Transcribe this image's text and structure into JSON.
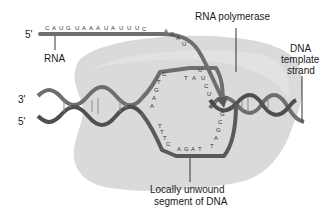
{
  "figure": {
    "colors": {
      "background": "#ffffff",
      "polymerase": "#dcdcdc",
      "strand": "#6e6e6e",
      "strand_dark": "#4a4a4a",
      "text": "#1a1a1a"
    }
  },
  "labels": {
    "rna_5prime": "5'",
    "rna": "RNA",
    "rna_polymerase": "RNA polymerase",
    "dna_template_line1": "DNA",
    "dna_template_line2": "template",
    "dna_template_line3": "strand",
    "dna_3prime": "3'",
    "dna_5prime": "5'",
    "unwound_line1": "Locally unwound",
    "unwound_line2": "segment of DNA"
  },
  "sequences": {
    "rna_top": "CAUGUAAAUAUUUCAGAU",
    "rna_top_bases": [
      "C",
      "A",
      "U",
      "G",
      "U",
      "A",
      "A",
      "A",
      "U",
      "A",
      "U",
      "U",
      "U",
      "C",
      "A",
      "G",
      "A",
      "U"
    ],
    "rna_in_bubble": [
      "U",
      "U",
      "C",
      "U",
      "G"
    ],
    "coding_strand_bubble": [
      "A",
      "A",
      "G",
      "T",
      "C",
      "T",
      "A"
    ],
    "template_strand_bubble": [
      "A",
      "G",
      "A",
      "T",
      "T",
      "A",
      "G",
      "C",
      "G"
    ],
    "template_bottom_left": [
      "T",
      "T",
      "T",
      "C"
    ]
  }
}
